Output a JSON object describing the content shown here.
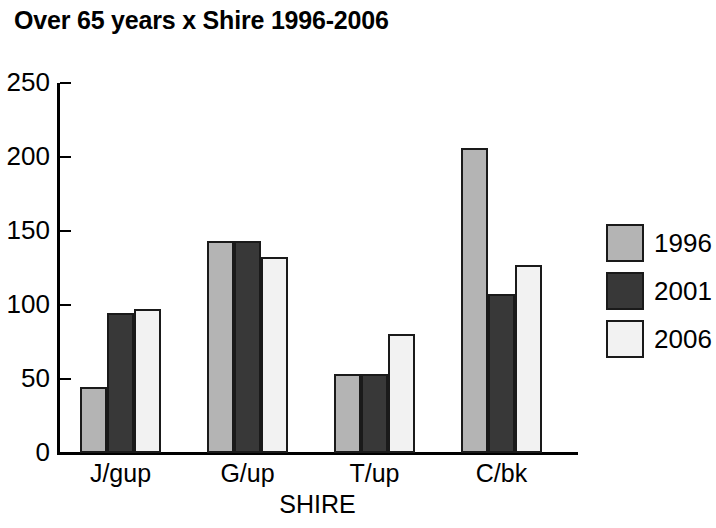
{
  "chart_data": {
    "type": "bar",
    "title": "Over 65 years x Shire 1996-2006",
    "xlabel": "SHIRE",
    "ylabel": "",
    "categories": [
      "J/gup",
      "G/up",
      "T/up",
      "C/bk"
    ],
    "series": [
      {
        "name": "1996",
        "color": "#b4b4b4",
        "values": [
          43,
          142,
          52,
          205
        ]
      },
      {
        "name": "2001",
        "color": "#383838",
        "values": [
          93,
          142,
          52,
          106
        ]
      },
      {
        "name": "2006",
        "color": "#f2f2f2",
        "values": [
          96,
          131,
          79,
          126
        ]
      }
    ],
    "ylim": [
      0,
      250
    ],
    "yticks": [
      0,
      50,
      100,
      150,
      200,
      250
    ],
    "ytick_labels": [
      "0",
      "50",
      "100",
      "150",
      "200",
      "250"
    ],
    "grid": false,
    "legend_position": "right",
    "axis_color": "#000000",
    "bar_edge_color": "#1a1a1a"
  },
  "legend": {
    "entries": [
      {
        "label": "1996"
      },
      {
        "label": "2001"
      },
      {
        "label": "2006"
      }
    ]
  }
}
